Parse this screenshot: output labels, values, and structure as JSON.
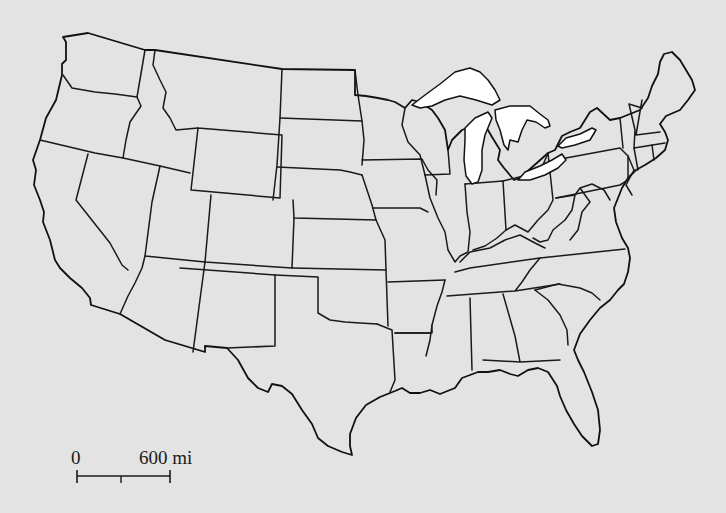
{
  "map": {
    "title": "Contiguous United States outline map",
    "background_color": "#e3e3e3",
    "border_color": "#1a1a1a",
    "lake_color": "#ffffff",
    "features": [
      "state-borders",
      "great-lakes",
      "scale-bar"
    ]
  },
  "scale_bar": {
    "start_label": "0",
    "end_label": "600 mi",
    "distance": 600,
    "unit": "mi"
  }
}
